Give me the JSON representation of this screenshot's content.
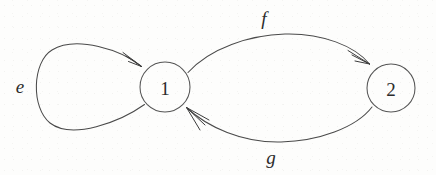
{
  "figure": {
    "kind": "directed-graph",
    "background_color": "#fdfdfc",
    "stroke_color": "#4a4a4a",
    "label_color": "#2b2b2b"
  },
  "nodes": [
    {
      "id": "1",
      "label": "1",
      "cx": 165,
      "cy": 87,
      "r": 25
    },
    {
      "id": "2",
      "label": "2",
      "cx": 391,
      "cy": 88,
      "r": 24
    }
  ],
  "edges": [
    {
      "id": "e",
      "label": "e",
      "from": "1",
      "to": "1",
      "type": "self-loop",
      "label_x": 20,
      "label_y": 86
    },
    {
      "id": "f",
      "label": "f",
      "from": "1",
      "to": "2",
      "type": "arc-upper",
      "label_x": 264,
      "label_y": 18
    },
    {
      "id": "g",
      "label": "g",
      "from": "2",
      "to": "1",
      "type": "arc-lower",
      "label_x": 271,
      "label_y": 157
    }
  ]
}
